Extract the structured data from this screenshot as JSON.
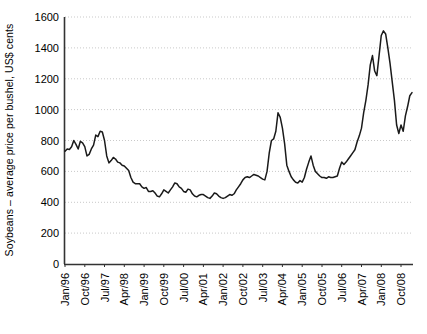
{
  "chart_data": {
    "type": "line",
    "title": "",
    "xlabel": "",
    "ylabel": "Soybeans – average price per bushel, US$ cents",
    "ylim": [
      0,
      1600
    ],
    "ytick_labels": [
      "0",
      "200",
      "400",
      "600",
      "800",
      "1000",
      "1200",
      "1400",
      "1600"
    ],
    "ytick_values": [
      0,
      200,
      400,
      600,
      800,
      1000,
      1200,
      1400,
      1600
    ],
    "grid": true,
    "grid_style": "dotted-horizontal",
    "legend": "none",
    "line_color": "#1a1a1a",
    "xtick_labels": [
      "Jan/96",
      "Oct/96",
      "Jul/97",
      "Apr/98",
      "Jan/99",
      "Oct/99",
      "Jul/00",
      "Apr/01",
      "Jan/02",
      "Oct/02",
      "Jul/03",
      "Apr/04",
      "Jan/05",
      "Oct/05",
      "Jul/06",
      "Apr/07",
      "Jan/08",
      "Oct/08"
    ],
    "x_start": "Jan/96",
    "x_interval_months": 1,
    "xtick_interval_months": 9,
    "series": [
      {
        "name": "Soybeans average price",
        "values": [
          730,
          745,
          742,
          760,
          800,
          775,
          745,
          795,
          785,
          760,
          700,
          710,
          745,
          770,
          835,
          825,
          860,
          855,
          800,
          700,
          655,
          670,
          690,
          680,
          660,
          655,
          640,
          635,
          620,
          605,
          560,
          530,
          520,
          520,
          520,
          500,
          490,
          495,
          470,
          470,
          475,
          460,
          440,
          435,
          455,
          480,
          470,
          460,
          480,
          500,
          525,
          520,
          500,
          490,
          470,
          465,
          485,
          480,
          455,
          440,
          435,
          445,
          450,
          450,
          440,
          430,
          425,
          440,
          460,
          455,
          440,
          430,
          425,
          430,
          440,
          450,
          445,
          455,
          480,
          500,
          520,
          545,
          560,
          565,
          560,
          570,
          580,
          575,
          570,
          560,
          550,
          545,
          600,
          720,
          800,
          810,
          860,
          980,
          950,
          880,
          780,
          640,
          600,
          565,
          545,
          530,
          525,
          540,
          530,
          560,
          615,
          660,
          700,
          640,
          600,
          585,
          570,
          560,
          560,
          555,
          565,
          560,
          560,
          565,
          570,
          620,
          660,
          645,
          660,
          680,
          700,
          720,
          740,
          790,
          830,
          880,
          980,
          1060,
          1160,
          1290,
          1350,
          1250,
          1220,
          1350,
          1480,
          1510,
          1490,
          1400,
          1300,
          1180,
          1060,
          900,
          845,
          900,
          860,
          960,
          1020,
          1090,
          1110
        ]
      }
    ]
  }
}
